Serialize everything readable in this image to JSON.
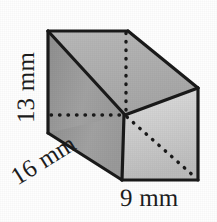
{
  "figure": {
    "kind": "rectangular-prism-diagram",
    "background_color": "#fefefe",
    "stroke_color": "#1a1a1a"
  },
  "labels": {
    "height": "13 mm",
    "depth": "16 mm",
    "width": "9 mm"
  },
  "measurements": [
    {
      "name": "height",
      "value": 13,
      "unit": "mm",
      "text": "13 mm",
      "rotation_deg": -90
    },
    {
      "name": "depth",
      "value": 16,
      "unit": "mm",
      "text": "16 mm",
      "rotation_deg": -32
    },
    {
      "name": "width",
      "value": 9,
      "unit": "mm",
      "text": "9 mm",
      "rotation_deg": 0
    }
  ],
  "faces": {
    "left_face_color": "#9b9b9b",
    "top_face_color": "#b0b0b0",
    "front_face_color": "#cfcfcf"
  },
  "geometry": {
    "front_top_left": [
      48,
      31
    ],
    "back_top_left": [
      128,
      31
    ],
    "back_top_right": [
      198,
      88
    ],
    "back_bottom_right": [
      198,
      180
    ],
    "front_bottom_right": [
      122,
      180
    ],
    "front_bottom_left": [
      48,
      133
    ],
    "inner_top_corner": [
      125,
      115
    ],
    "hidden_vertical_x": 125,
    "hidden_horizontal_y": 115
  }
}
